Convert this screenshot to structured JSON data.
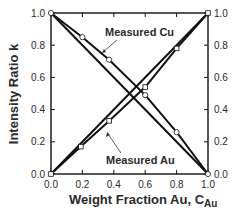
{
  "chart_data": {
    "type": "line",
    "title": "",
    "xlabel": "Weight Fraction Au, C",
    "xlabel_subscript": "Au",
    "ylabel": "Intensity Ratio k",
    "xlim": [
      0.0,
      1.0
    ],
    "ylim": [
      0.0,
      1.0
    ],
    "x_ticks": [
      "0.0",
      "0.2",
      "0.4",
      "0.6",
      "0.8",
      "1.0"
    ],
    "y_ticks": [
      "0.0",
      "0.2",
      "0.4",
      "0.6",
      "0.8",
      "1.0"
    ],
    "right_y_ticks": [
      "0.0",
      "0.2",
      "0.4",
      "0.6",
      "0.8",
      "1.0"
    ],
    "grid": false,
    "legend": "none (inline annotations)",
    "series": [
      {
        "name": "Measured Cu",
        "marker": "circle",
        "x": [
          0.0,
          0.2,
          0.37,
          0.6,
          0.8,
          1.0
        ],
        "values": [
          1.0,
          0.85,
          0.71,
          0.49,
          0.26,
          0.0
        ]
      },
      {
        "name": "Measured Au",
        "marker": "square",
        "x": [
          0.0,
          0.19,
          0.37,
          0.6,
          0.8,
          1.0
        ],
        "values": [
          0.0,
          0.17,
          0.33,
          0.54,
          0.78,
          1.0
        ]
      },
      {
        "name": "Cu reference (linear)",
        "marker": "none",
        "x": [
          0.0,
          1.0
        ],
        "values": [
          1.0,
          0.0
        ]
      },
      {
        "name": "Au reference (linear)",
        "marker": "none",
        "x": [
          0.0,
          1.0
        ],
        "values": [
          0.0,
          1.0
        ]
      }
    ],
    "annotations": [
      {
        "text": "Measured Cu",
        "points_to_series": "Measured Cu"
      },
      {
        "text": "Measured Au",
        "points_to_series": "Measured Au"
      }
    ]
  },
  "colors": {
    "line": "#111111",
    "text": "#2a2a2a",
    "marker_fill": "#ffffff"
  }
}
